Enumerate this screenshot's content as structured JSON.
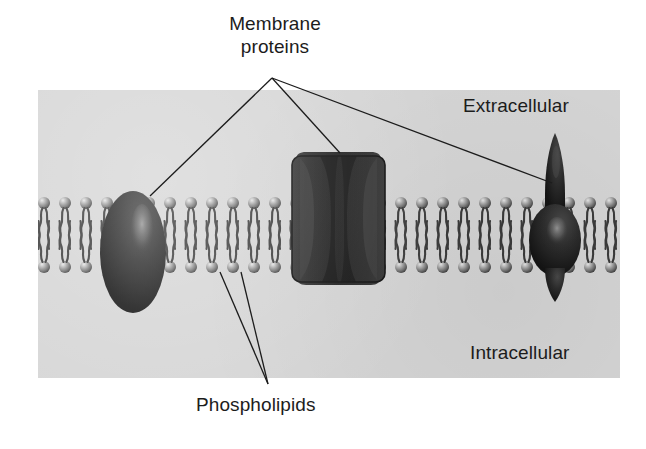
{
  "figure": {
    "panel_letter": "A",
    "background_color": "#ffffff",
    "panel_color": "#d6d6d6",
    "ink_color": "#1c1c1c",
    "protein_color": "#2b2b2b",
    "head_color": "#7d7d7d"
  },
  "labels": {
    "membrane_proteins": "Membrane\nproteins",
    "membrane_proteins_line1": "Membrane",
    "membrane_proteins_line2": "proteins",
    "extracellular": "Extracellular",
    "intracellular": "Intracellular",
    "phospholipids": "Phospholipids"
  },
  "diagram": {
    "type": "phospholipid-bilayer",
    "regions": [
      {
        "name": "extracellular",
        "position": "above-bilayer"
      },
      {
        "name": "intracellular",
        "position": "below-bilayer"
      }
    ],
    "bilayer": {
      "head_count_per_leaflet": 28,
      "head_spacing_px": 21,
      "upper_head_y": 203,
      "lower_head_y": 267,
      "head_radius_px": 6,
      "tails_per_head": 2
    },
    "proteins": [
      {
        "name": "peripheral-ellipse-protein",
        "shape": "ellipse",
        "cx": 133,
        "cy": 252,
        "rx": 33,
        "ry": 61
      },
      {
        "name": "channel-protein",
        "shape": "hourglass-channel",
        "x": 292,
        "y": 152,
        "width": 93,
        "height": 133
      },
      {
        "name": "receptor-spike-protein",
        "shape": "spike-bulb",
        "cx": 555,
        "top_y": 133,
        "bottom_y": 300
      }
    ],
    "leader_lines": [
      {
        "name": "to-ellipse-protein",
        "from": [
          272,
          78
        ],
        "to": [
          150,
          196
        ]
      },
      {
        "name": "to-channel-protein",
        "from": [
          272,
          78
        ],
        "to": [
          340,
          153
        ]
      },
      {
        "name": "to-spike-protein",
        "from": [
          272,
          78
        ],
        "to": [
          552,
          183
        ]
      },
      {
        "name": "to-phospholipid-left",
        "from": [
          268,
          384
        ],
        "to": [
          220,
          272
        ]
      },
      {
        "name": "to-phospholipid-right",
        "from": [
          268,
          384
        ],
        "to": [
          241,
          272
        ]
      }
    ]
  }
}
